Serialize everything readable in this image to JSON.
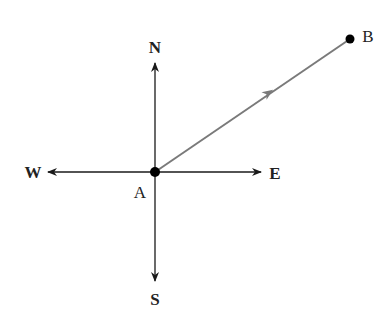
{
  "diagram": {
    "compass": {
      "north": "N",
      "south": "S",
      "east": "E",
      "west": "W"
    },
    "points": {
      "origin": "A",
      "target": "B"
    },
    "colors": {
      "axes": "#1a1a1a",
      "vector": "#7a7a7a",
      "points": "#000000"
    }
  }
}
